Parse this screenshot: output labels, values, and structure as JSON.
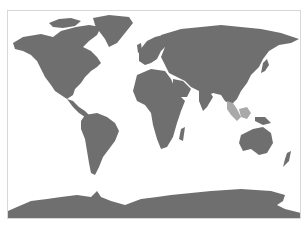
{
  "map": {
    "type": "world-map",
    "projection": "cylindrical (Miller-like)",
    "land_color": "#6f6f6f",
    "highlight_color": "#a9a9a9",
    "ocean_color": "#ffffff",
    "frame_color": "#d8d8d8",
    "highlighted_region": "Southeast Asia (Malay Peninsula, Sumatra, Borneo)"
  }
}
